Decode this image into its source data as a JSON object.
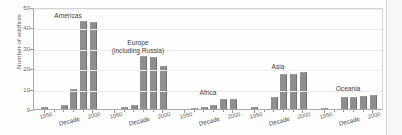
{
  "chart_data": {
    "type": "bar",
    "title": "",
    "xlabel": "Decade",
    "ylabel": "Number of wildfires",
    "ylim": [
      0,
      50
    ],
    "yticks": [
      0,
      10,
      20,
      30,
      40,
      50
    ],
    "grid": true,
    "legend": null,
    "panel_xticklabels": [
      "1950",
      "2000"
    ],
    "panels": [
      {
        "name": "Americas",
        "label_lines": [
          "Americas"
        ],
        "categories": [
          "1950",
          "1960",
          "1970",
          "1980",
          "1990",
          "2000"
        ],
        "values": [
          1,
          0,
          1.8,
          10,
          43,
          42.5
        ]
      },
      {
        "name": "Europe (including Russia)",
        "label_lines": [
          "Europe",
          "(including Russia)"
        ],
        "categories": [
          "1950",
          "1960",
          "1970",
          "1980",
          "1990",
          "2000"
        ],
        "values": [
          0,
          1,
          2,
          26,
          25.5,
          21
        ]
      },
      {
        "name": "Africa",
        "label_lines": [
          "Africa"
        ],
        "categories": [
          "1950",
          "1960",
          "1970",
          "1980",
          "1990",
          "2000"
        ],
        "values": [
          0,
          0.5,
          1.2,
          2,
          5,
          4.7
        ]
      },
      {
        "name": "Asia",
        "label_lines": [
          "Asia"
        ],
        "categories": [
          "1950",
          "1960",
          "1970",
          "1980",
          "1990",
          "2000"
        ],
        "values": [
          1.2,
          0,
          6,
          17,
          17,
          18
        ]
      },
      {
        "name": "Oceania",
        "label_lines": [
          "Oceania"
        ],
        "categories": [
          "1950",
          "1960",
          "1970",
          "1980",
          "1990",
          "2000"
        ],
        "values": [
          0.6,
          0,
          6,
          6,
          6.5,
          7
        ]
      }
    ]
  }
}
